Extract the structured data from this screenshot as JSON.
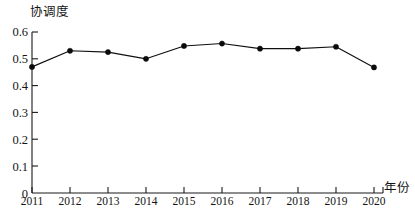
{
  "chart_data": {
    "type": "line",
    "title": "",
    "xlabel": "年份",
    "ylabel": "协调度",
    "categories": [
      "2011",
      "2012",
      "2013",
      "2014",
      "2015",
      "2016",
      "2017",
      "2018",
      "2019",
      "2020"
    ],
    "values": [
      0.47,
      0.53,
      0.525,
      0.5,
      0.548,
      0.557,
      0.538,
      0.538,
      0.545,
      0.468
    ],
    "series": [
      {
        "name": "协调度",
        "values": [
          0.47,
          0.53,
          0.525,
          0.5,
          0.548,
          0.557,
          0.538,
          0.538,
          0.545,
          0.468
        ]
      }
    ],
    "ylim": [
      0,
      0.6
    ],
    "yticks": [
      "0",
      "0.1",
      "0.2",
      "0.3",
      "0.4",
      "0.5",
      "0.6"
    ],
    "ytick_values": [
      0,
      0.1,
      0.2,
      0.3,
      0.4,
      0.5,
      0.6
    ],
    "xlim": [
      "2011",
      "2020"
    ],
    "grid": false,
    "legend": false,
    "legend_position": "none",
    "marker": "filled-circle",
    "line_color": "#101010",
    "marker_color": "#0b0b0b",
    "axis_color": "#1a1a1a",
    "background_color": "#ffffff"
  }
}
